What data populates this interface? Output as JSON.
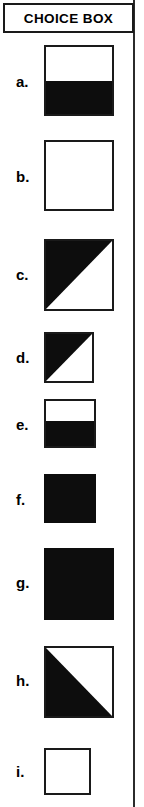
{
  "header": {
    "title": "CHOICE BOX"
  },
  "colors": {
    "fill": "#0d0d0d",
    "background": "#ffffff",
    "border": "#1a1a1a",
    "rule": "#2b2b2b"
  },
  "choices": [
    {
      "label": "a.",
      "shape_name": "square-top-white-bottom-black",
      "pattern": "horizontal-half",
      "black_portion": "bottom",
      "black_fraction": 0.5,
      "size": "large"
    },
    {
      "label": "b.",
      "shape_name": "square-empty",
      "pattern": "empty",
      "black_portion": "none",
      "black_fraction": 0.0,
      "size": "large"
    },
    {
      "label": "c.",
      "shape_name": "square-upper-left-triangle-black",
      "pattern": "diagonal",
      "black_portion": "upper-left",
      "black_fraction": 0.5,
      "size": "large"
    },
    {
      "label": "d.",
      "shape_name": "square-upper-left-triangle-black-small",
      "pattern": "diagonal",
      "black_portion": "upper-left",
      "black_fraction": 0.5,
      "size": "small"
    },
    {
      "label": "e.",
      "shape_name": "square-top-white-bottom-black-small",
      "pattern": "horizontal-half",
      "black_portion": "bottom",
      "black_fraction": 0.55,
      "size": "small"
    },
    {
      "label": "f.",
      "shape_name": "square-solid-black-small",
      "pattern": "solid",
      "black_portion": "all",
      "black_fraction": 1.0,
      "size": "small"
    },
    {
      "label": "g.",
      "shape_name": "square-solid-black",
      "pattern": "solid",
      "black_portion": "all",
      "black_fraction": 1.0,
      "size": "large"
    },
    {
      "label": "h.",
      "shape_name": "square-lower-left-triangle-black",
      "pattern": "diagonal",
      "black_portion": "lower-left",
      "black_fraction": 0.5,
      "size": "large"
    },
    {
      "label": "i.",
      "shape_name": "square-empty-small",
      "pattern": "empty",
      "black_portion": "none",
      "black_fraction": 0.0,
      "size": "small"
    }
  ]
}
